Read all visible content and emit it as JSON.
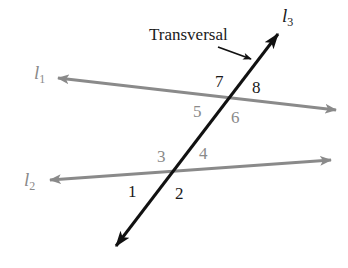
{
  "diagram": {
    "colors": {
      "transversal": "#111111",
      "parallel_lines": "#8a8a8a",
      "dark_label": "#1a1a1a",
      "gray_label": "#8a8a8a",
      "background": "#ffffff"
    },
    "lines": {
      "l1": {
        "name": "l",
        "sub": "1",
        "x1": 58,
        "y1": 78,
        "x2": 336,
        "y2": 110
      },
      "l2": {
        "name": "l",
        "sub": "2",
        "x1": 50,
        "y1": 180,
        "x2": 331,
        "y2": 160
      },
      "l3": {
        "name": "l",
        "sub": "3",
        "x1": 116,
        "y1": 246,
        "x2": 278,
        "y2": 34
      }
    },
    "callout": {
      "text": "Transversal"
    },
    "angles": [
      {
        "id": "1",
        "label": "1"
      },
      {
        "id": "2",
        "label": "2"
      },
      {
        "id": "3",
        "label": "3"
      },
      {
        "id": "4",
        "label": "4"
      },
      {
        "id": "5",
        "label": "5"
      },
      {
        "id": "6",
        "label": "6"
      },
      {
        "id": "7",
        "label": "7"
      },
      {
        "id": "8",
        "label": "8"
      }
    ]
  }
}
